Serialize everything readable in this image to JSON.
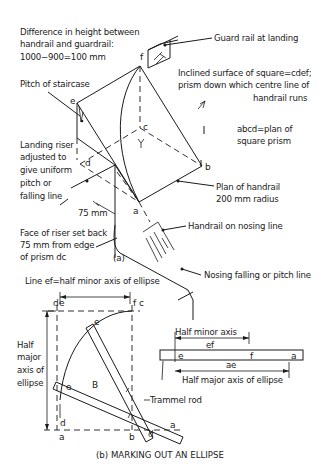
{
  "figure_a": {
    "caption": "(a)",
    "labels": {
      "height_diff_1": "Difference in height between",
      "height_diff_2": "handrail and guardrail:",
      "height_diff_3": "1000−900=100 mm",
      "guard_rail": "Guard rail at landing",
      "inclined_1": "Inclined surface of square=cdef;",
      "inclined_2": "prism down which centre line of",
      "inclined_3": "handrail runs",
      "pitch": "Pitch of staircase",
      "abcd_1": "abcd=plan of",
      "abcd_2": "square prism",
      "landing_1": "Landing riser",
      "landing_2": "adjusted to",
      "landing_3": "give uniform",
      "landing_4": "pitch or",
      "landing_5": "falling line",
      "plan_1": "Plan of handrail",
      "plan_2": "200 mm radius",
      "dim_75": "75 mm",
      "nosing_handrail": "Handrail on nosing line",
      "face_1": "Face of riser set back",
      "face_2": "75 mm from edge",
      "face_3": "of prism dc",
      "nosing_pitch": "Nosing falling or pitch line"
    },
    "points": {
      "a": "a",
      "b": "b",
      "c": "c",
      "d": "d",
      "e": "e",
      "f": "f"
    }
  },
  "figure_b": {
    "caption": "(b) MARKING OUT AN ELLIPSE",
    "labels": {
      "line_ef": "Line ef=half minor axis of ellipse",
      "half_major_1": "Half",
      "half_major_2": "major",
      "half_major_3": "axis of",
      "half_major_4": "ellipse",
      "region_b": "B",
      "trammel": "Trammel rod",
      "half_minor": "Half minor axis",
      "ef": "ef",
      "ae": "ae",
      "half_major_rod": "Half major axis of ellipse"
    },
    "points": {
      "a": "a",
      "b": "b",
      "c": "c",
      "d": "d",
      "e": "e",
      "f": "f"
    }
  }
}
